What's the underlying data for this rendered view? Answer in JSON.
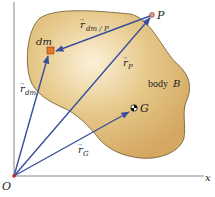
{
  "diagram": {
    "colors": {
      "body_fill_light": "#f7e7c0",
      "body_fill_dark": "#d9b069",
      "body_stroke": "#6b5530",
      "vector": "#3a4f9c",
      "axis": "#777777",
      "dm_fill": "#e8762a",
      "origin": "#d02020",
      "point_p": "#d08070"
    },
    "axes": {
      "x_label": "x",
      "origin_label": "O"
    },
    "body": {
      "label": "body",
      "name": "B"
    },
    "points": {
      "dm": {
        "label": "dm"
      },
      "P": {
        "label": "P"
      },
      "G": {
        "label": "G"
      }
    },
    "vectors": {
      "r_dm": {
        "base": "r",
        "sub": "dm"
      },
      "r_P": {
        "base": "r",
        "sub": "P"
      },
      "r_G": {
        "base": "r",
        "sub": "G"
      },
      "r_dm_P": {
        "base": "r",
        "sub": "dm / P"
      }
    },
    "arrow_glyph": "→"
  }
}
